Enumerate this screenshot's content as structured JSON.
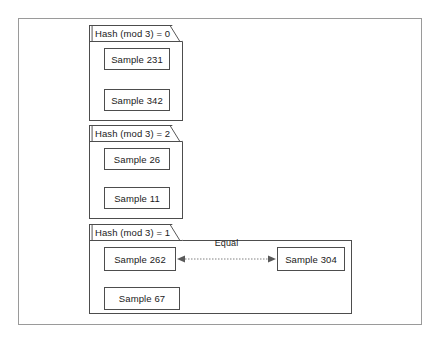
{
  "diagram": {
    "frame": {
      "name": "outer-frame"
    },
    "colors": {
      "background": "#ffffff",
      "frame_border": "#9a9a9a",
      "shape_border": "#4d4d4d",
      "text": "#1a1a1a",
      "connector": "#808080"
    },
    "buckets": [
      {
        "label": "Hash (mod 3) = 0",
        "samples": [
          {
            "label": "Sample 231"
          },
          {
            "label": "Sample 342"
          }
        ]
      },
      {
        "label": "Hash (mod 3) = 2",
        "samples": [
          {
            "label": "Sample 26"
          },
          {
            "label": "Sample 11"
          }
        ]
      },
      {
        "label": "Hash (mod 3) = 1",
        "samples": [
          {
            "label": "Sample 262"
          },
          {
            "label": "Sample 304"
          },
          {
            "label": "Sample 67"
          }
        ]
      }
    ],
    "connectors": [
      {
        "label": "Equal",
        "from": "Sample 262",
        "to": "Sample 304",
        "style": "dotted",
        "arrowheads": "both"
      }
    ]
  }
}
